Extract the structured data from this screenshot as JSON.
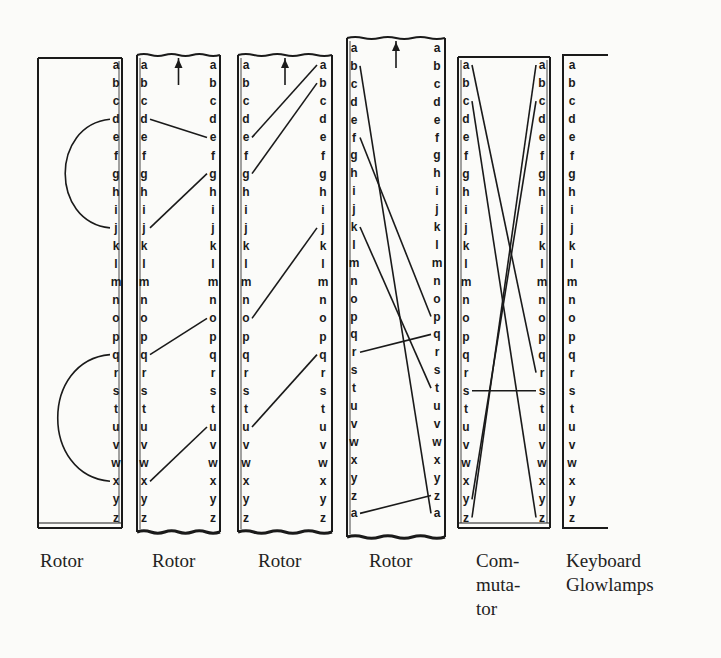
{
  "diagram": {
    "type": "rotor-cipher-wiring",
    "alphabet": [
      "a",
      "b",
      "c",
      "d",
      "e",
      "f",
      "g",
      "h",
      "i",
      "j",
      "k",
      "l",
      "m",
      "n",
      "o",
      "p",
      "q",
      "r",
      "s",
      "t",
      "u",
      "v",
      "w",
      "x",
      "y",
      "z"
    ],
    "components": [
      {
        "id": "rotor-1",
        "label": "Rotor",
        "kind": "reflector-rotor",
        "columns": [
          "right"
        ],
        "right_letters": [
          "a",
          "b",
          "c",
          "d",
          "e",
          "f",
          "g",
          "h",
          "i",
          "j",
          "k",
          "l",
          "m",
          "n",
          "o",
          "p",
          "q",
          "r",
          "s",
          "t",
          "u",
          "v",
          "w",
          "x",
          "y",
          "z"
        ],
        "arrow": false,
        "connections": [
          {
            "from": "d",
            "to": "j",
            "style": "arc"
          },
          {
            "from": "q",
            "to": "x",
            "style": "arc"
          }
        ]
      },
      {
        "id": "rotor-2",
        "label": "Rotor",
        "kind": "rotor",
        "arrow": true,
        "left_letters": [
          "a",
          "b",
          "c",
          "d",
          "e",
          "f",
          "g",
          "h",
          "i",
          "j",
          "k",
          "l",
          "m",
          "n",
          "o",
          "p",
          "q",
          "r",
          "s",
          "t",
          "u",
          "v",
          "w",
          "x",
          "y",
          "z"
        ],
        "right_letters": [
          "a",
          "b",
          "c",
          "d",
          "e",
          "f",
          "g",
          "h",
          "i",
          "j",
          "k",
          "l",
          "m",
          "n",
          "o",
          "p",
          "q",
          "r",
          "s",
          "t",
          "u",
          "v",
          "w",
          "x",
          "y",
          "z"
        ],
        "connections": [
          {
            "left": "d",
            "right": "e"
          },
          {
            "left": "j",
            "right": "g"
          },
          {
            "left": "q",
            "right": "o"
          },
          {
            "left": "x",
            "right": "u"
          }
        ]
      },
      {
        "id": "rotor-3",
        "label": "Rotor",
        "kind": "rotor",
        "arrow": true,
        "left_letters": [
          "a",
          "b",
          "c",
          "d",
          "e",
          "f",
          "g",
          "h",
          "i",
          "j",
          "k",
          "l",
          "m",
          "n",
          "o",
          "p",
          "q",
          "r",
          "s",
          "t",
          "u",
          "v",
          "w",
          "x",
          "y",
          "z"
        ],
        "right_letters": [
          "a",
          "b",
          "c",
          "d",
          "e",
          "f",
          "g",
          "h",
          "i",
          "j",
          "k",
          "l",
          "m",
          "n",
          "o",
          "p",
          "q",
          "r",
          "s",
          "t",
          "u",
          "v",
          "w",
          "x",
          "y",
          "z"
        ],
        "connections": [
          {
            "left": "e",
            "right": "a"
          },
          {
            "left": "g",
            "right": "b"
          },
          {
            "left": "o",
            "right": "j"
          },
          {
            "left": "u",
            "right": "q"
          }
        ]
      },
      {
        "id": "rotor-4",
        "label": "Rotor",
        "kind": "rotor",
        "arrow": true,
        "left_letters": [
          "a",
          "b",
          "c",
          "d",
          "e",
          "f",
          "g",
          "h",
          "i",
          "j",
          "k",
          "l",
          "m",
          "n",
          "o",
          "p",
          "q",
          "r",
          "s",
          "t",
          "u",
          "v",
          "w",
          "x",
          "y",
          "z",
          "a"
        ],
        "right_letters": [
          "a",
          "b",
          "c",
          "d",
          "e",
          "f",
          "g",
          "h",
          "i",
          "j",
          "k",
          "l",
          "m",
          "n",
          "o",
          "p",
          "q",
          "r",
          "s",
          "t",
          "u",
          "v",
          "w",
          "x",
          "y",
          "z",
          "a"
        ],
        "connections": [
          {
            "left_index": 1,
            "right_index": 26,
            "left": "b",
            "right": "a"
          },
          {
            "left_index": 5,
            "right_index": 15,
            "left": "f",
            "right": "p"
          },
          {
            "left_index": 10,
            "right_index": 19,
            "left": "k",
            "right": "t"
          },
          {
            "left_index": 17,
            "right_index": 16,
            "left": "r",
            "right": "q"
          },
          {
            "left_index": 26,
            "right_index": 25,
            "left": "a",
            "right": "z"
          }
        ]
      },
      {
        "id": "commutator",
        "label": "Com-\nmuta-\ntor",
        "label_lines": [
          "Com-",
          "muta-",
          "tor"
        ],
        "kind": "commutator",
        "arrow": false,
        "left_letters": [
          "a",
          "b",
          "c",
          "d",
          "e",
          "f",
          "g",
          "h",
          "i",
          "j",
          "k",
          "l",
          "m",
          "n",
          "o",
          "p",
          "q",
          "r",
          "s",
          "t",
          "u",
          "v",
          "w",
          "x",
          "y",
          "z"
        ],
        "right_letters": [
          "a",
          "b",
          "c",
          "d",
          "e",
          "f",
          "g",
          "h",
          "i",
          "j",
          "k",
          "l",
          "m",
          "n",
          "o",
          "p",
          "q",
          "r",
          "s",
          "t",
          "u",
          "v",
          "w",
          "x",
          "y",
          "z"
        ],
        "connections": [
          {
            "left": "a",
            "right": "r"
          },
          {
            "left": "c",
            "right": "z"
          },
          {
            "left": "z",
            "right": "a"
          },
          {
            "left": "y",
            "right": "c"
          },
          {
            "left": "s",
            "right": "s"
          }
        ]
      },
      {
        "id": "keyboard-glowlamps",
        "label": "Keyboard\nGlowlamps",
        "label_lines": [
          "Keyboard",
          "Glowlamps"
        ],
        "kind": "keyboard",
        "arrow": false,
        "letters": [
          "a",
          "b",
          "c",
          "d",
          "e",
          "f",
          "g",
          "h",
          "i",
          "j",
          "k",
          "l",
          "m",
          "n",
          "o",
          "p",
          "q",
          "r",
          "s",
          "t",
          "u",
          "v",
          "w",
          "x",
          "y",
          "z"
        ]
      }
    ]
  },
  "labels": {
    "rotor_1": "Rotor",
    "rotor_2": "Rotor",
    "rotor_3": "Rotor",
    "rotor_4": "Rotor",
    "commutator": [
      "Com-",
      "muta-",
      "tor"
    ],
    "keyboard": [
      "Keyboard",
      "Glowlamps"
    ]
  },
  "colors": {
    "ink": "#1a1a1a",
    "paper": "#fbfbf9"
  }
}
